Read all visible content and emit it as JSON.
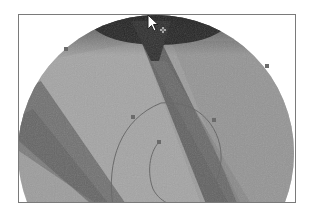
{
  "canvas": {
    "background": "#ffffff",
    "frame_border_color": "#7a7a7a",
    "magnified_view": {
      "shape": "circle",
      "center": [
        137,
        138
      ],
      "radius": 138,
      "tones": {
        "base": "#9a9a9a",
        "light_band": "#a8a8a8",
        "dark_band": "#5e5e5e",
        "top_dark": "#2a2a2a"
      }
    },
    "path_overlay": {
      "stroke_color": "#6b6b6b",
      "handles": [
        {
          "name": "handle-1",
          "x": 132,
          "y": 116
        },
        {
          "name": "handle-2",
          "x": 213,
          "y": 119
        },
        {
          "name": "handle-3",
          "x": 158,
          "y": 141
        },
        {
          "name": "handle-4",
          "x": 208,
          "y": 186
        },
        {
          "name": "handle-5",
          "x": 65,
          "y": 48
        },
        {
          "name": "handle-6",
          "x": 266,
          "y": 65
        }
      ]
    }
  },
  "cursor": {
    "type": "arrow-with-plus",
    "x": 147,
    "y": 14
  }
}
